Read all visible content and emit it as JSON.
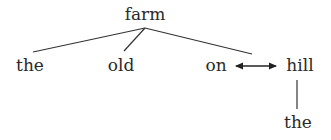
{
  "diagram": {
    "type": "dependency-tree",
    "root": {
      "label": "farm"
    },
    "level1": [
      {
        "label": "the"
      },
      {
        "label": "old"
      },
      {
        "label": "on"
      },
      {
        "label": "hill"
      }
    ],
    "level2": [
      {
        "label": "the"
      }
    ],
    "edges": [
      {
        "from": "farm",
        "to": "the",
        "style": "line"
      },
      {
        "from": "farm",
        "to": "old",
        "style": "line"
      },
      {
        "from": "farm",
        "to": "on",
        "style": "line"
      },
      {
        "from": "on",
        "to": "hill",
        "style": "double-arrow"
      },
      {
        "from": "hill",
        "to": "the",
        "style": "line"
      }
    ]
  }
}
